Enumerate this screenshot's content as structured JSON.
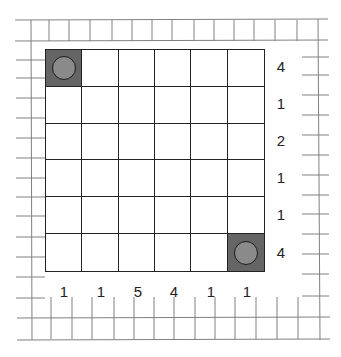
{
  "puzzle": {
    "rows": 6,
    "cols": 6,
    "row_clues": [
      "4",
      "1",
      "2",
      "1",
      "1",
      "4"
    ],
    "col_clues": [
      "1",
      "1",
      "5",
      "4",
      "1",
      "1"
    ],
    "pieces": [
      {
        "row": 0,
        "col": 0,
        "type": "filled-with-circle"
      },
      {
        "row": 5,
        "col": 5,
        "type": "filled-with-circle"
      }
    ]
  },
  "colors": {
    "grid_line": "#222222",
    "background_grid": "#777777",
    "filled_cell": "#656565",
    "circle": "#8a8a8a"
  }
}
